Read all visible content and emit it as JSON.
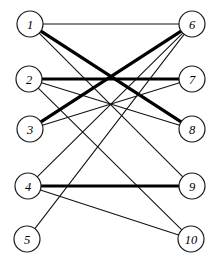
{
  "figure": {
    "background_color": "#ffffff",
    "width": 214,
    "height": 268
  },
  "style": {
    "node_fill": "#ffffff",
    "node_stroke": "#1a1a1a",
    "edge_color": "#111111",
    "thin_width": 1.05,
    "thick_width": 3.2,
    "node_radius": 13
  },
  "chart_data": {
    "type": "diagram",
    "subtype": "bipartite-graph",
    "title": "",
    "xlabel": "",
    "ylabel": "",
    "left_partition": [
      "1",
      "2",
      "3",
      "4",
      "5"
    ],
    "right_partition": [
      "6",
      "7",
      "8",
      "9",
      "10"
    ],
    "nodes": [
      {
        "id": "n1",
        "label": "1",
        "x": 30,
        "y": 24,
        "side": "left"
      },
      {
        "id": "n2",
        "label": "2",
        "x": 29,
        "y": 79,
        "side": "left"
      },
      {
        "id": "n3",
        "label": "3",
        "x": 30,
        "y": 129,
        "side": "left"
      },
      {
        "id": "n4",
        "label": "4",
        "x": 28,
        "y": 186,
        "side": "left"
      },
      {
        "id": "n5",
        "label": "5",
        "x": 27,
        "y": 239,
        "side": "left"
      },
      {
        "id": "n6",
        "label": "6",
        "x": 192,
        "y": 24,
        "side": "right"
      },
      {
        "id": "n7",
        "label": "7",
        "x": 192,
        "y": 79,
        "side": "right"
      },
      {
        "id": "n8",
        "label": "8",
        "x": 192,
        "y": 129,
        "side": "right"
      },
      {
        "id": "n9",
        "label": "9",
        "x": 192,
        "y": 186,
        "side": "right"
      },
      {
        "id": "n10",
        "label": "10",
        "x": 191,
        "y": 239,
        "side": "right"
      }
    ],
    "edges": [
      {
        "id": "e1",
        "from": "n1",
        "to": "n6",
        "weight": "thin"
      },
      {
        "id": "e2",
        "from": "n1",
        "to": "n8",
        "weight": "thick"
      },
      {
        "id": "e3",
        "from": "n1",
        "to": "n9",
        "weight": "thin"
      },
      {
        "id": "e4",
        "from": "n2",
        "to": "n7",
        "weight": "thick"
      },
      {
        "id": "e5",
        "from": "n2",
        "to": "n8",
        "weight": "thin"
      },
      {
        "id": "e6",
        "from": "n2",
        "to": "n10",
        "weight": "thin"
      },
      {
        "id": "e7",
        "from": "n3",
        "to": "n6",
        "weight": "thick"
      },
      {
        "id": "e8",
        "from": "n3",
        "to": "n7",
        "weight": "thin"
      },
      {
        "id": "e9",
        "from": "n4",
        "to": "n6",
        "weight": "thin"
      },
      {
        "id": "e10",
        "from": "n4",
        "to": "n9",
        "weight": "thick"
      },
      {
        "id": "e11",
        "from": "n4",
        "to": "n10",
        "weight": "thin"
      },
      {
        "id": "e12",
        "from": "n5",
        "to": "n6",
        "weight": "thin"
      }
    ],
    "edge_count": 12,
    "node_count": 10
  }
}
